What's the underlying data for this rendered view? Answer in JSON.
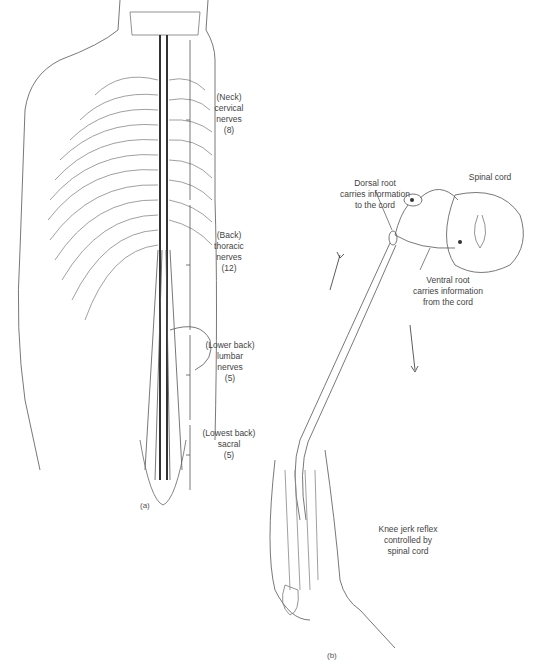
{
  "figure": {
    "panel_a": {
      "caption": "(a)",
      "regions": [
        {
          "lines": [
            "(Neck)",
            "cervical",
            "nerves",
            "(8)"
          ]
        },
        {
          "lines": [
            "(Back)",
            "thoracic",
            "nerves",
            "(12)"
          ]
        },
        {
          "lines": [
            "(Lower back)",
            "lumbar",
            "nerves",
            "(5)"
          ]
        },
        {
          "lines": [
            "(Lowest back)",
            "sacral",
            "(5)"
          ]
        }
      ]
    },
    "panel_b": {
      "caption": "(b)",
      "spinal_cord_label": "Spinal cord",
      "dorsal_root_label": [
        "Dorsal root",
        "carries information",
        "to the cord"
      ],
      "ventral_root_label": [
        "Ventral root",
        "carries information",
        "from the cord"
      ],
      "reflex_label": [
        "Knee jerk reflex",
        "controlled by",
        "spinal cord"
      ]
    }
  }
}
